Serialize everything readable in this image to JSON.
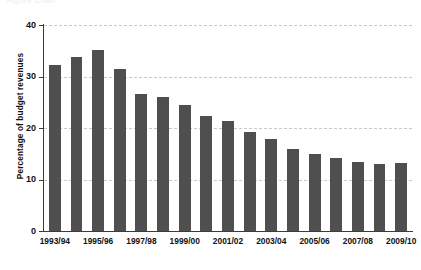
{
  "figure": {
    "clipped_top_caption": "Figure   Chart"
  },
  "chart_data": {
    "type": "bar",
    "title": "",
    "xlabel": "",
    "ylabel": "Percentage of budget revenues",
    "ylim": [
      0,
      40
    ],
    "yticks": [
      0,
      10,
      20,
      30,
      40
    ],
    "ytick_labels": [
      "0",
      "10",
      "20",
      "30",
      "40"
    ],
    "grid": true,
    "grid_axis": "y",
    "legend": false,
    "bar_color": "#4f4f4f",
    "categories": [
      "1993/94",
      "1994/95",
      "1995/96",
      "1996/97",
      "1997/98",
      "1998/99",
      "1999/00",
      "2000/01",
      "2001/02",
      "2002/03",
      "2003/04",
      "2004/05",
      "2005/06",
      "2006/07",
      "2007/08",
      "2008/09",
      "2009/10"
    ],
    "visible_tick_labels": [
      "1993/94",
      "",
      "1995/96",
      "",
      "1997/98",
      "",
      "1999/00",
      "",
      "2001/02",
      "",
      "2003/04",
      "",
      "2005/06",
      "",
      "2007/08",
      "",
      "2009/10"
    ],
    "values": [
      32.3,
      33.7,
      35.1,
      31.4,
      26.7,
      26.0,
      24.4,
      22.4,
      21.4,
      19.3,
      17.8,
      15.9,
      15.0,
      14.2,
      13.4,
      13.0,
      13.2
    ]
  }
}
